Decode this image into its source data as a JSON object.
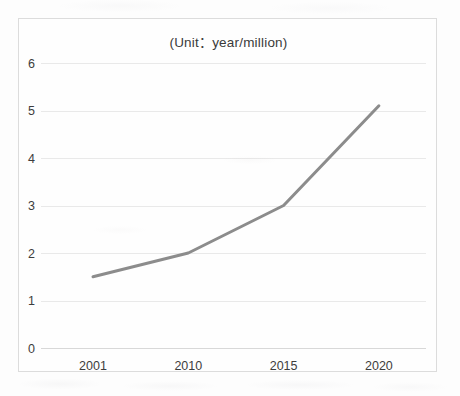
{
  "chart_data": {
    "type": "line",
    "title": "(Unit：year/million)",
    "xlabel": "",
    "ylabel": "",
    "categories": [
      "2001",
      "2010",
      "2015",
      "2020"
    ],
    "x": [
      2001,
      2010,
      2015,
      2020
    ],
    "values": [
      1.5,
      2.0,
      3.0,
      5.1
    ],
    "series": [
      {
        "name": "value",
        "values": [
          1.5,
          2.0,
          3.0,
          5.1
        ]
      }
    ],
    "ylim": [
      0,
      6
    ],
    "y_ticks": [
      0,
      1,
      2,
      3,
      4,
      5,
      6
    ],
    "y_tick_labels": [
      "0",
      "1",
      "2",
      "3",
      "4",
      "5",
      "6"
    ],
    "x_tick_labels": [
      "2001",
      "2010",
      "2015",
      "2020"
    ],
    "grid": true,
    "grid_axis": "y",
    "legend": false,
    "legend_position": "none",
    "markers": false,
    "annotations": [],
    "line_color": "#8c8c8c",
    "line_width": 3,
    "gridline_color": "#e9e9e9",
    "plot_border_color": "#dcdcdc",
    "background_color": "#fdfdfd",
    "text_color": "#3a3a3a"
  }
}
